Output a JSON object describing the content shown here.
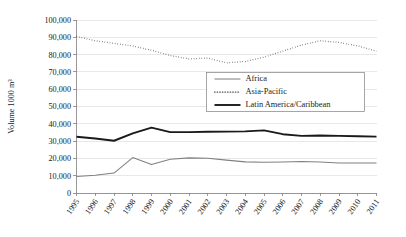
{
  "chart_data": {
    "type": "line",
    "title": "",
    "xlabel": "",
    "ylabel": "Volume 1000 m³",
    "ylim": [
      0,
      100000
    ],
    "ytick_labels": [
      "0",
      "10,000",
      "20,000",
      "30,000",
      "40,000",
      "50,000",
      "60,000",
      "70,000",
      "80,000",
      "90,000",
      "100,000"
    ],
    "ytick_values": [
      0,
      10000,
      20000,
      30000,
      40000,
      50000,
      60000,
      70000,
      80000,
      90000,
      100000
    ],
    "grid": true,
    "legend_position": "center-right",
    "categories": [
      "1995",
      "1996",
      "1997",
      "1998",
      "1999",
      "2000",
      "2001",
      "2002",
      "2003",
      "2004",
      "2005",
      "2006",
      "2007",
      "2008",
      "2009",
      "2010",
      "2011"
    ],
    "series": [
      {
        "name": "Africa",
        "style": "solid-thin-gray",
        "color": "#808080",
        "values": [
          9500,
          10300,
          11500,
          20500,
          16500,
          19500,
          20300,
          20100,
          19000,
          18000,
          17800,
          17900,
          18200,
          17900,
          17300,
          17400,
          17300
        ]
      },
      {
        "name": "Asia-Pacific",
        "style": "dotted",
        "color": "#4d4d4d",
        "values": [
          90500,
          88000,
          86500,
          85000,
          82500,
          79500,
          77500,
          78000,
          75200,
          76000,
          78500,
          82000,
          85500,
          88000,
          87000,
          85000,
          82000
        ]
      },
      {
        "name": "Latin America/Caribbean",
        "style": "solid-thick-black",
        "color": "#1a1a1a",
        "values": [
          32500,
          31500,
          30200,
          34500,
          37800,
          35200,
          35200,
          35400,
          35500,
          35600,
          36200,
          34000,
          33000,
          33200,
          33000,
          32800,
          32600
        ]
      }
    ]
  }
}
